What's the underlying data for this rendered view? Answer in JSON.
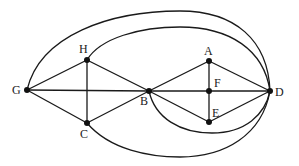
{
  "diagram": {
    "type": "graph",
    "nodes": [
      {
        "id": "G",
        "label": "G",
        "x": 27,
        "y": 90,
        "lx": 12,
        "ly": 94
      },
      {
        "id": "H",
        "label": "H",
        "x": 87,
        "y": 60,
        "lx": 79,
        "ly": 53
      },
      {
        "id": "C",
        "label": "C",
        "x": 87,
        "y": 123,
        "lx": 80,
        "ly": 138
      },
      {
        "id": "B",
        "label": "B",
        "x": 149,
        "y": 91,
        "lx": 140,
        "ly": 105
      },
      {
        "id": "A",
        "label": "A",
        "x": 209,
        "y": 61,
        "lx": 204,
        "ly": 55
      },
      {
        "id": "F",
        "label": "F",
        "x": 209,
        "y": 91,
        "lx": 214,
        "ly": 87
      },
      {
        "id": "E",
        "label": "E",
        "x": 209,
        "y": 122,
        "lx": 212,
        "ly": 117
      },
      {
        "id": "D",
        "label": "D",
        "x": 270,
        "y": 91,
        "lx": 275,
        "ly": 96
      }
    ],
    "edges": [
      {
        "from": "G",
        "to": "H"
      },
      {
        "from": "G",
        "to": "C"
      },
      {
        "from": "G",
        "to": "B"
      },
      {
        "from": "H",
        "to": "C"
      },
      {
        "from": "H",
        "to": "B"
      },
      {
        "from": "C",
        "to": "B"
      },
      {
        "from": "B",
        "to": "A"
      },
      {
        "from": "B",
        "to": "E"
      },
      {
        "from": "B",
        "to": "D"
      },
      {
        "from": "A",
        "to": "F"
      },
      {
        "from": "F",
        "to": "E"
      },
      {
        "from": "A",
        "to": "D"
      },
      {
        "from": "E",
        "to": "D"
      }
    ],
    "arcs": [
      {
        "from": "G",
        "to": "D",
        "side": "top",
        "d": "M27,90 C40,35 110,11 180,11 C235,11 268,40 270,91"
      },
      {
        "from": "H",
        "to": "D",
        "side": "top",
        "d": "M87,60 C100,38 140,27 180,27 C230,27 264,50 270,91"
      },
      {
        "from": "C",
        "to": "D",
        "side": "bottom",
        "d": "M87,123 C110,150 150,157 180,157 C225,157 262,135 270,91"
      },
      {
        "from": "B",
        "to": "D",
        "side": "bottom",
        "d": "M149,91 C155,118 180,133 212,133 C245,133 265,115 270,91"
      }
    ]
  }
}
